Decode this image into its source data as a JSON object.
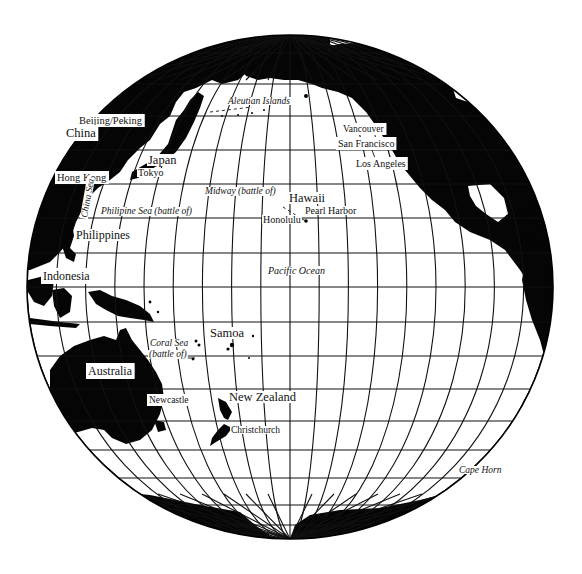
{
  "map": {
    "title": "Pacific Ocean globe",
    "colors": {
      "land": "#050505",
      "ocean": "#ffffff",
      "grid": "#111111"
    },
    "globe": {
      "cx": 290,
      "cy": 287,
      "rx": 263,
      "ry": 252
    },
    "grid": {
      "latitude_y": [
        53,
        84,
        116,
        150,
        184,
        218,
        253,
        287,
        322,
        356,
        389,
        421,
        450,
        478,
        505,
        525
      ],
      "meridian_count_each_side": 9,
      "meridian_spacing_px": 29.2
    },
    "labels": {
      "beijing": {
        "text": "Beijing/Peking",
        "x": 79,
        "y": 124,
        "size": 10.5,
        "italic": false,
        "boxed": true
      },
      "china": {
        "text": "China",
        "x": 66,
        "y": 137,
        "size": 12.5,
        "italic": false,
        "boxed": true
      },
      "hong_kong": {
        "text": "Hong Kong",
        "x": 57,
        "y": 181,
        "size": 10.5,
        "italic": false,
        "boxed": true
      },
      "china_sea": {
        "text": "China Sea",
        "x": 87,
        "y": 218,
        "size": 9.5,
        "italic": true,
        "boxed": false,
        "rotate": -80
      },
      "japan": {
        "text": "Japan",
        "x": 148,
        "y": 164,
        "size": 12.5,
        "italic": false,
        "boxed": false
      },
      "tokyo": {
        "text": "Tokyo",
        "x": 138,
        "y": 176,
        "size": 10,
        "italic": false,
        "boxed": false
      },
      "philipine_sea": {
        "text": "Philipine Sea (battle of)",
        "x": 101,
        "y": 214,
        "size": 9.5,
        "italic": true,
        "boxed": false
      },
      "philippines": {
        "text": "Philippines",
        "x": 76,
        "y": 239,
        "size": 12,
        "italic": false,
        "boxed": false
      },
      "indonesia": {
        "text": "Indonesia",
        "x": 43,
        "y": 280,
        "size": 12,
        "italic": false,
        "boxed": true
      },
      "aleutian": {
        "text": "Aleutian Islands",
        "x": 228,
        "y": 104,
        "size": 9.5,
        "italic": true,
        "boxed": false
      },
      "vancouver": {
        "text": "Vancouver",
        "x": 343,
        "y": 132,
        "size": 9.5,
        "italic": false,
        "boxed": true
      },
      "san_francisco": {
        "text": "San Francisco",
        "x": 338,
        "y": 147,
        "size": 10,
        "italic": false,
        "boxed": true
      },
      "los_angeles": {
        "text": "Los Angeles",
        "x": 356,
        "y": 167,
        "size": 10,
        "italic": false,
        "boxed": true
      },
      "midway": {
        "text": "Midway (battle of)",
        "x": 205,
        "y": 194,
        "size": 9.5,
        "italic": true,
        "boxed": false
      },
      "hawaii": {
        "text": "Hawaii",
        "x": 289,
        "y": 202,
        "size": 12.5,
        "italic": false,
        "boxed": false
      },
      "pearl_harbor": {
        "text": "Pearl Harbor",
        "x": 305,
        "y": 214,
        "size": 10,
        "italic": false,
        "boxed": false
      },
      "honolulu": {
        "text": "Honolulu",
        "x": 263,
        "y": 223,
        "size": 10,
        "italic": false,
        "boxed": false
      },
      "pacific_ocean": {
        "text": "Pacific Ocean",
        "x": 268,
        "y": 274,
        "size": 10,
        "italic": true,
        "boxed": false
      },
      "samoa": {
        "text": "Samoa",
        "x": 210,
        "y": 337,
        "size": 12.5,
        "italic": false,
        "boxed": false
      },
      "coral_sea": {
        "text": "Coral Sea",
        "x": 150,
        "y": 346,
        "size": 9.5,
        "italic": true,
        "boxed": false
      },
      "coral_sea_battle": {
        "text": "(battle of)",
        "x": 149,
        "y": 357,
        "size": 9.5,
        "italic": true,
        "boxed": false
      },
      "australia": {
        "text": "Australia",
        "x": 88,
        "y": 375,
        "size": 12,
        "italic": false,
        "boxed": true
      },
      "newcastle": {
        "text": "Newcastle",
        "x": 149,
        "y": 403,
        "size": 9.5,
        "italic": false,
        "boxed": true
      },
      "new_zealand": {
        "text": "New Zealand",
        "x": 229,
        "y": 401,
        "size": 12.5,
        "italic": false,
        "boxed": false
      },
      "christchurch": {
        "text": "Christchurch",
        "x": 231,
        "y": 433,
        "size": 9.5,
        "italic": false,
        "boxed": false
      },
      "cape_horn": {
        "text": "Cape Horn",
        "x": 459,
        "y": 473,
        "size": 9.5,
        "italic": true,
        "boxed": false
      }
    }
  }
}
